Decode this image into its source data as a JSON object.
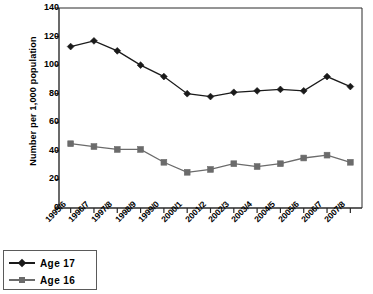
{
  "chart_data": {
    "type": "line",
    "title": "",
    "subtitle": "",
    "xlabel": "",
    "ylabel": "Number per 1,000 population",
    "ylim": [
      0,
      140
    ],
    "ytick_step": 20,
    "yticks": [
      0,
      20,
      40,
      60,
      80,
      100,
      120,
      140
    ],
    "grid": false,
    "legend_position": "bottom-left",
    "categories": [
      "1995/6",
      "1996/7",
      "1997/8",
      "1998/9",
      "1999/0",
      "2000/1",
      "2001/2",
      "2002/3",
      "2003/4",
      "2004/5",
      "2005/6",
      "2006/7",
      "2007/8"
    ],
    "series": [
      {
        "name": "Age 17",
        "color": "#1a1a1a",
        "marker": "diamond",
        "values": [
          113,
          117,
          110,
          100,
          92,
          80,
          78,
          81,
          82,
          83,
          82,
          92,
          85
        ]
      },
      {
        "name": "Age 16",
        "color": "#6b6b6b",
        "marker": "square",
        "values": [
          45,
          43,
          41,
          41,
          32,
          25,
          27,
          31,
          29,
          31,
          35,
          37,
          32
        ]
      }
    ]
  },
  "axis": {
    "y_title": "Number per 1,000 population",
    "y_tick_labels": [
      "140",
      "120",
      "100",
      "80",
      "60",
      "40",
      "20",
      "0"
    ],
    "x_tick_labels": [
      "1995/6",
      "1996/7",
      "1997/8",
      "1998/9",
      "1999/0",
      "2000/1",
      "2001/2",
      "2002/3",
      "2003/4",
      "2004/5",
      "2005/6",
      "2006/7",
      "2007/8"
    ]
  },
  "legend": {
    "items": [
      {
        "label": "Age 17",
        "color": "#1a1a1a",
        "marker": "diamond"
      },
      {
        "label": "Age 16",
        "color": "#6b6b6b",
        "marker": "square"
      }
    ]
  },
  "colors": {
    "age17": "#1a1a1a",
    "age16": "#6b6b6b",
    "axis": "#2a2a2a",
    "frame": "#2a2a2a",
    "background": "#ffffff"
  }
}
